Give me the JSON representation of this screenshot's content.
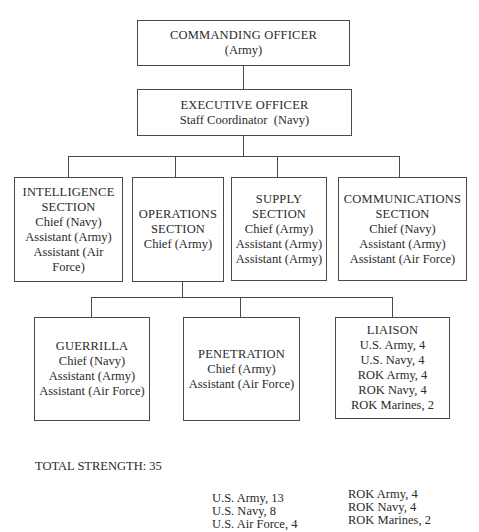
{
  "org_chart": {
    "commanding_officer": {
      "title": "COMMANDING OFFICER",
      "lines": [
        "(Army)"
      ]
    },
    "executive_officer": {
      "title": "EXECUTIVE OFFICER",
      "lines": [
        "Staff Coordinator  (Navy)"
      ]
    },
    "sections": [
      {
        "title_lines": [
          "INTELLIGENCE",
          "SECTION"
        ],
        "lines": [
          "Chief (Navy)",
          "Assistant (Army)",
          "Assistant (Air",
          "Force)"
        ]
      },
      {
        "title_lines": [
          "OPERATIONS",
          "SECTION"
        ],
        "lines": [
          "Chief (Army)"
        ]
      },
      {
        "title_lines": [
          "SUPPLY",
          "SECTION"
        ],
        "lines": [
          "Chief (Army)",
          "Assistant (Army)",
          "Assistant (Army)"
        ]
      },
      {
        "title_lines": [
          "COMMUNICATIONS",
          "SECTION"
        ],
        "lines": [
          "Chief (Navy)",
          "Assistant (Army)",
          "Assistant (Air Force)"
        ]
      }
    ],
    "operations_units": [
      {
        "title": "GUERRILLA",
        "lines": [
          "Chief (Navy)",
          "Assistant (Army)",
          "Assistant (Air Force)"
        ]
      },
      {
        "title": "PENETRATION",
        "lines": [
          "Chief (Army)",
          "Assistant (Air Force)"
        ]
      },
      {
        "title": "LIAISON",
        "lines": [
          "U.S. Army, 4",
          "U.S. Navy, 4",
          "ROK Army, 4",
          "ROK Navy, 4",
          "ROK Marines, 2"
        ]
      }
    ]
  },
  "totals": {
    "label": "TOTAL STRENGTH: 35",
    "us": [
      "U.S. Army, 13",
      "U.S. Navy, 8",
      "U.S. Air Force, 4"
    ],
    "rok": [
      "ROK Army, 4",
      "ROK Navy, 4",
      "ROK Marines, 2"
    ]
  }
}
